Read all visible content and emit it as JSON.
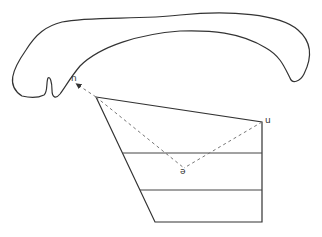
{
  "diagram": {
    "type": "vowel-chart-with-palate",
    "palate_outline": {
      "description": "sagittal outline of the hard palate and upper vocal tract",
      "stroke": "#333333"
    },
    "vowel_quadrilateral": {
      "stroke": "#333333",
      "corners": {
        "top_left": [
          96,
          97
        ],
        "top_right": [
          262,
          122
        ],
        "bottom_right": [
          262,
          222
        ],
        "bottom_left": [
          155,
          222
        ]
      },
      "horizontal_dividers": [
        {
          "y": 153,
          "x_start": 123,
          "x_end": 262
        },
        {
          "y": 190,
          "x_start": 140,
          "x_end": 262
        }
      ]
    },
    "dashed_lines": {
      "stroke": "#777777",
      "paths": [
        {
          "from": [
            96,
            97
          ],
          "to": [
            184,
            168
          ]
        },
        {
          "from": [
            262,
            122
          ],
          "to": [
            184,
            168
          ]
        },
        {
          "from": [
            96,
            97
          ],
          "to": [
            76,
            84
          ],
          "arrow": true
        }
      ]
    },
    "labels": [
      {
        "id": "n",
        "text": "n",
        "x": 70,
        "y": 73
      },
      {
        "id": "u",
        "text": "u",
        "x": 265,
        "y": 116
      },
      {
        "id": "schwa",
        "text": "ə",
        "x": 180,
        "y": 167
      }
    ]
  }
}
